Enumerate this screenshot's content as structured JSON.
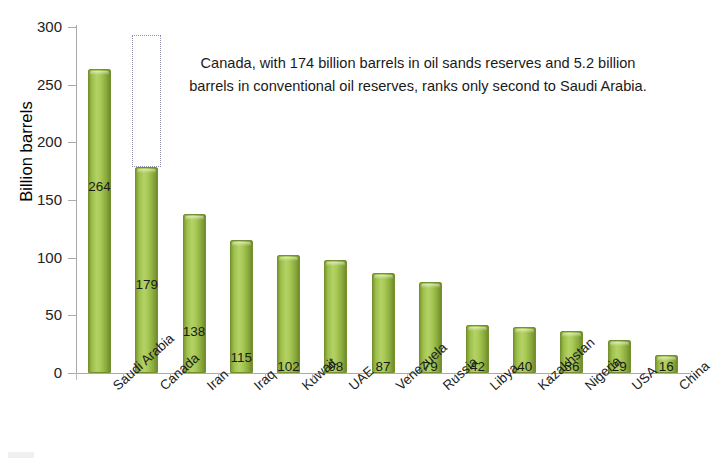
{
  "chart_data": {
    "type": "bar",
    "title": "",
    "xlabel": "",
    "ylabel": "Billion barrels",
    "ylim": [
      0,
      300
    ],
    "yticks": [
      0,
      50,
      100,
      150,
      200,
      250,
      300
    ],
    "grid": false,
    "legend": null,
    "categories": [
      "Saudi Arabia",
      "Canada",
      "Iran",
      "Iraq",
      "Kuwait",
      "UAE",
      "Venezuela",
      "Russia",
      "Libya",
      "Kazakhstan",
      "Nigeria",
      "USA",
      "China"
    ],
    "values": [
      264,
      179,
      138,
      115,
      102,
      98,
      87,
      79,
      42,
      40,
      36,
      29,
      16
    ],
    "annotations": [
      {
        "name": "canada-note",
        "text": "Canada, with 174 billion barrels in oil sands reserves and 5.2 billion barrels in conventional oil reserves, ranks only second to Saudi Arabia."
      },
      {
        "name": "oil-sands-outline",
        "category": "Canada",
        "from": 179,
        "to": 293,
        "style": "dotted-rectangle"
      }
    ],
    "bar_color": "#9cc04a",
    "bar_edge_color": "#75912f",
    "axis_color": "#aaaaaa",
    "label_color": "#1a1a1a"
  },
  "axis": {
    "y_title": "Billion barrels",
    "y_ticks": [
      "0",
      "50",
      "100",
      "150",
      "200",
      "250",
      "300"
    ]
  },
  "annotation": {
    "text": "Canada, with 174 billion barrels in oil sands reserves and 5.2 billion barrels in conventional oil reserves, ranks only second to Saudi Arabia."
  }
}
